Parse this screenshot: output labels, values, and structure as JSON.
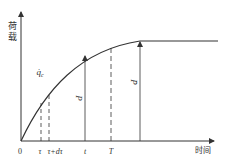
{
  "figure": {
    "y_axis_label_chars": [
      "荷",
      "载"
    ],
    "x_axis_label": "时间",
    "origin_label": "0",
    "markers": [
      {
        "id": "tau",
        "label": "τ",
        "style": "dashed"
      },
      {
        "id": "tau-dtau",
        "label": "τ+dτ",
        "style": "dashed"
      },
      {
        "id": "t",
        "label": "t",
        "style": "solid-arrow"
      },
      {
        "id": "T",
        "label": "T",
        "style": "dashed"
      }
    ],
    "curve_label": "q̇",
    "curve_label_sub": "c",
    "p_label": "P",
    "p_bar_label": "P̄",
    "colors": {
      "line": "#333333",
      "background": "#ffffff"
    }
  }
}
